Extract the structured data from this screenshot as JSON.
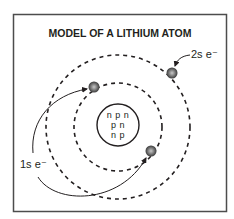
{
  "diagram": {
    "title": "MODEL OF A LITHIUM ATOM",
    "nucleus": {
      "rows": [
        "n p n",
        "p n",
        "n p"
      ]
    },
    "labels": {
      "outer_electron": "2s e⁻",
      "inner_electrons": "1s e⁻"
    },
    "shells": [
      {
        "name": "1s",
        "electrons": 2
      },
      {
        "name": "2s",
        "electrons": 1
      }
    ],
    "colors": {
      "frame": "#4d4d4d",
      "ink": "#231f20",
      "electron": "#6d6e71"
    }
  }
}
